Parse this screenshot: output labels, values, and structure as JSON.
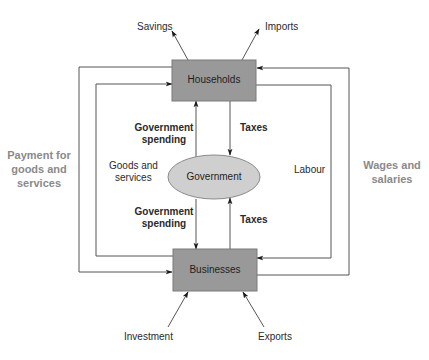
{
  "diagram": {
    "type": "circular-flow-of-income",
    "colors": {
      "box_fill": "#999999",
      "box_stroke": "#7a7a7a",
      "ellipse_fill": "#cfcfcf",
      "ellipse_stroke": "#8a8a8a",
      "line": "#555555",
      "side_label": "#8a8a8a"
    },
    "nodes": {
      "households": {
        "label": "Households"
      },
      "businesses": {
        "label": "Businesses"
      },
      "government": {
        "label": "Government"
      }
    },
    "leakages": {
      "savings": "Savings",
      "imports": "Imports"
    },
    "injections": {
      "investment": "Investment",
      "exports": "Exports"
    },
    "inner_labels": {
      "gov_spending_top_line1": "Government",
      "gov_spending_top_line2": "spending",
      "gov_spending_bottom_line1": "Government",
      "gov_spending_bottom_line2": "spending",
      "taxes_top": "Taxes",
      "taxes_bottom": "Taxes",
      "goods_services_line1": "Goods and",
      "goods_services_line2": "services",
      "labour": "Labour"
    },
    "side_labels": {
      "payment_line1": "Payment for",
      "payment_line2": "goods and",
      "payment_line3": "services",
      "wages_line1": "Wages and",
      "wages_line2": "salaries"
    },
    "flows": [
      {
        "from": "Businesses",
        "to": "Households",
        "label": "Goods and services"
      },
      {
        "from": "Households",
        "to": "Businesses",
        "label": "Payment for goods and services"
      },
      {
        "from": "Households",
        "to": "Businesses",
        "label": "Labour"
      },
      {
        "from": "Businesses",
        "to": "Households",
        "label": "Wages and salaries"
      },
      {
        "from": "Government",
        "to": "Households",
        "label": "Government spending"
      },
      {
        "from": "Households",
        "to": "Government",
        "label": "Taxes"
      },
      {
        "from": "Government",
        "to": "Businesses",
        "label": "Government spending"
      },
      {
        "from": "Businesses",
        "to": "Government",
        "label": "Taxes"
      },
      {
        "from": "Households",
        "to": "outside",
        "label": "Savings"
      },
      {
        "from": "Households",
        "to": "outside",
        "label": "Imports"
      },
      {
        "from": "outside",
        "to": "Businesses",
        "label": "Investment"
      },
      {
        "from": "outside",
        "to": "Businesses",
        "label": "Exports"
      }
    ]
  }
}
